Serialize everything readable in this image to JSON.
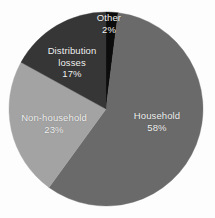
{
  "chart_data": {
    "type": "pie",
    "title": "",
    "subtitle": "",
    "xlabel": "",
    "ylabel": "",
    "legend_position": "none",
    "grid": false,
    "labels_inside_slices": true,
    "start_angle_deg": 0,
    "direction": "clockwise",
    "categories": [
      "Other",
      "Household",
      "Non-household",
      "Distribution losses"
    ],
    "values": [
      2,
      58,
      23,
      17
    ],
    "value_unit": "%",
    "slices": [
      {
        "name": "Other",
        "value": 2,
        "value_label": "2%",
        "color": "#0c0c0c",
        "text_color": "#f2f2f2",
        "start_deg": 0,
        "end_deg": 7.2
      },
      {
        "name": "Household",
        "value": 58,
        "value_label": "58%",
        "color": "#6a6a6a",
        "text_color": "#f2f2f2",
        "start_deg": 7.2,
        "end_deg": 216
      },
      {
        "name": "Non-household",
        "value": 23,
        "value_label": "23%",
        "color": "#a3a3a3",
        "text_color": "#f5f5f5",
        "start_deg": 216,
        "end_deg": 298.8
      },
      {
        "name": "Distribution losses",
        "value": 17,
        "value_label": "17%",
        "color": "#363636",
        "text_color": "#f2f2f2",
        "start_deg": 298.8,
        "end_deg": 360
      }
    ]
  },
  "labels": {
    "household": {
      "name": "Household",
      "value": "58%"
    },
    "nonhousehold": {
      "name": "Non-household",
      "value": "23%"
    },
    "distribution": {
      "name_line1": "Distribution",
      "name_line2": "losses",
      "value": "17%"
    },
    "other": {
      "name": "Other",
      "value": "2%"
    }
  },
  "geometry": {
    "center_x": 106,
    "center_y": 109,
    "radius": 97
  },
  "colors": {
    "background": "#fdfdfd",
    "household": "#6a6a6a",
    "nonhousehold": "#a3a3a3",
    "distribution": "#363636",
    "other": "#0c0c0c"
  }
}
